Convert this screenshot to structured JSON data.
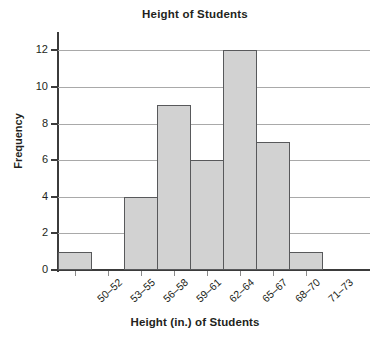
{
  "chart_data": {
    "type": "bar",
    "title": "Height of Students",
    "xlabel": "Height (in.) of Students",
    "ylabel": "Frequency",
    "categories": [
      "50–52",
      "53–55",
      "56–58",
      "59–61",
      "62–64",
      "65–67",
      "68–70",
      "71–73"
    ],
    "values": [
      1,
      0,
      4,
      9,
      6,
      12,
      7,
      1
    ],
    "ylim": [
      0,
      13
    ],
    "yticks": [
      0,
      2,
      4,
      6,
      8,
      10,
      12
    ],
    "ytick_labels": [
      "0",
      "2",
      "4",
      "6",
      "8",
      "10",
      "12"
    ],
    "grid": true,
    "legend": null,
    "bar_fill_color": "#d2d2d2",
    "bar_edge_color": "#58595b",
    "gridline_color": "#a9a9a9",
    "axis_color": "#3b3b3b",
    "text_color": "#231f20",
    "background_color": "#ffffff"
  }
}
